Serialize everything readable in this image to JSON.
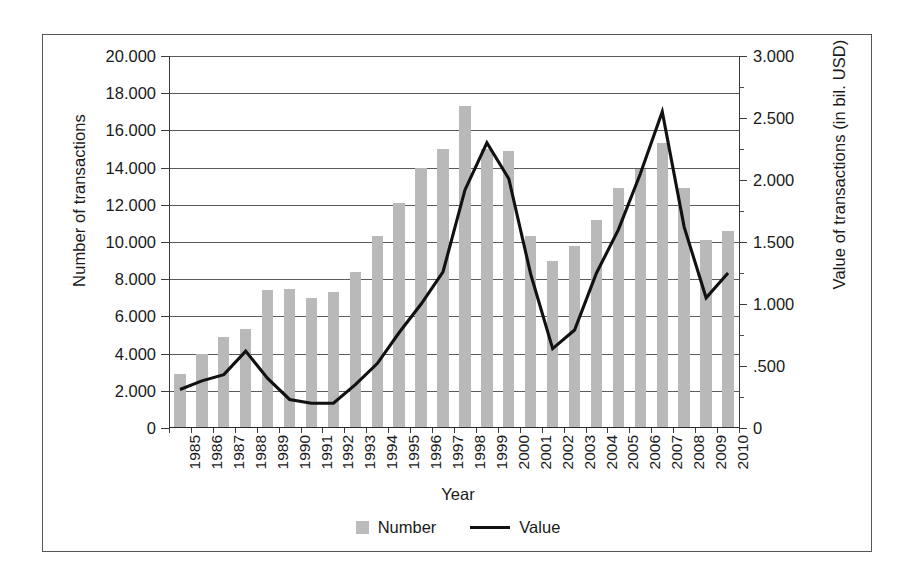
{
  "chart_data": {
    "type": "bar",
    "title": "",
    "xlabel": "Year",
    "ylabel": "Number of transactions",
    "y2label": "Value of transactions (in bil. USD)",
    "grid": true,
    "legend_position": "bottom",
    "categories": [
      "1985",
      "1986",
      "1987",
      "1988",
      "1989",
      "1990",
      "1991",
      "1992",
      "1993",
      "1994",
      "1995",
      "1996",
      "1997",
      "1998",
      "1999",
      "2000",
      "2001",
      "2002",
      "2003",
      "2004",
      "2005",
      "2006",
      "2007",
      "2008",
      "2009",
      "2010"
    ],
    "ylim": [
      0,
      20000
    ],
    "yticks": [
      0,
      2000,
      4000,
      6000,
      8000,
      10000,
      12000,
      14000,
      16000,
      18000,
      20000
    ],
    "ytick_labels": [
      "0",
      "2.000",
      "4.000",
      "6.000",
      "8.000",
      "10.000",
      "12.000",
      "14.000",
      "16.000",
      "18.000",
      "20.000"
    ],
    "y2lim": [
      0,
      3.0
    ],
    "y2ticks": [
      0,
      0.5,
      1.0,
      1.5,
      2.0,
      2.5,
      3.0
    ],
    "y2tick_labels": [
      "0",
      ".500",
      "1.000",
      "1.500",
      "2.000",
      "2.500",
      "3.000"
    ],
    "y2minor_ticks": [
      0.25,
      0.75,
      1.25,
      1.75,
      2.25,
      2.75
    ],
    "series": [
      {
        "name": "Number",
        "type": "bar",
        "axis": "left",
        "color": "#b9b9b9",
        "values": [
          2900,
          4000,
          4900,
          5300,
          7400,
          7500,
          7000,
          7300,
          8400,
          10300,
          12100,
          14000,
          15000,
          17300,
          15000,
          14900,
          10300,
          9000,
          9800,
          11200,
          12900,
          13900,
          15300,
          12900,
          10100,
          10600
        ]
      },
      {
        "name": "Value",
        "type": "line",
        "axis": "right",
        "color": "#111111",
        "values": [
          0.31,
          0.38,
          0.43,
          0.62,
          0.4,
          0.23,
          0.2,
          0.2,
          0.35,
          0.52,
          0.77,
          1.0,
          1.26,
          1.92,
          2.3,
          2.01,
          1.24,
          0.64,
          0.79,
          1.25,
          1.6,
          2.05,
          2.55,
          1.62,
          1.05,
          1.25
        ]
      }
    ],
    "legend": [
      {
        "label": "Number",
        "marker": "square-swatch",
        "color": "#b9b9b9"
      },
      {
        "label": "Value",
        "marker": "line-swatch",
        "color": "#111111"
      }
    ]
  }
}
